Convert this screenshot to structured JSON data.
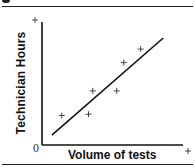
{
  "chart_data": {
    "type": "scatter",
    "title": "",
    "xlabel": "Volume of tests",
    "ylabel": "Technician Hours",
    "origin_label": "0",
    "axis_end_markers": [
      "+",
      "+"
    ],
    "xlim": [
      0,
      10
    ],
    "ylim": [
      0,
      10
    ],
    "grid": false,
    "legend": null,
    "series": [
      {
        "name": "observations",
        "marker": "+",
        "points": [
          {
            "x": 1.4,
            "y": 2.4
          },
          {
            "x": 3.3,
            "y": 2.5
          },
          {
            "x": 3.6,
            "y": 4.4
          },
          {
            "x": 5.3,
            "y": 4.4
          },
          {
            "x": 5.8,
            "y": 6.7
          },
          {
            "x": 7.0,
            "y": 7.8
          }
        ]
      }
    ],
    "trend_line": {
      "x1": 0.7,
      "y1": 0.8,
      "x2": 8.6,
      "y2": 8.7
    },
    "note": "Axis values are unlabeled; coordinates are relative positions on a 0-10 scale."
  },
  "colors": {
    "ink": "#111111",
    "background": "#ffffff"
  }
}
